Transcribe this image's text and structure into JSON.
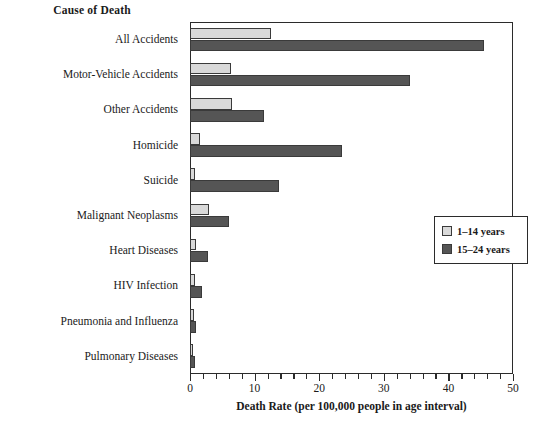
{
  "chart_data": {
    "type": "bar",
    "orientation": "horizontal",
    "title": "Cause of Death",
    "xlabel": "Death Rate (per 100,000 people in age interval)",
    "ylabel": "Cause of Death",
    "xlim": [
      0,
      50
    ],
    "xticks": [
      0,
      10,
      20,
      30,
      40,
      50
    ],
    "xticklabels": [
      "0",
      "10",
      "20",
      "30",
      "40",
      "50"
    ],
    "minor_tick_step": 2,
    "grid": false,
    "legend_position": "right-middle",
    "categories": [
      "All Accidents",
      "Motor-Vehicle Accidents",
      "Other Accidents",
      "Homicide",
      "Suicide",
      "Malignant Neoplasms",
      "Heart Diseases",
      "HIV Infection",
      "Pneumonia and Influenza",
      "Pulmonary Diseases"
    ],
    "series": [
      {
        "name": "1–14 years",
        "color": "#d9d9d9",
        "values": [
          12.5,
          6.3,
          6.5,
          1.5,
          0.7,
          3.0,
          1.0,
          0.8,
          0.6,
          0.5
        ]
      },
      {
        "name": "15–24 years",
        "color": "#555555",
        "values": [
          45.5,
          34.0,
          11.5,
          23.5,
          13.8,
          6.0,
          2.8,
          1.8,
          0.9,
          0.7
        ]
      }
    ]
  },
  "legend": {
    "entries": [
      {
        "label": "1–14 years"
      },
      {
        "label": "15–24 years"
      }
    ]
  },
  "colors": {
    "light_gray": "#d9d9d9",
    "dark_gray": "#555555",
    "axis": "#2b2b2b",
    "background": "#ffffff"
  }
}
